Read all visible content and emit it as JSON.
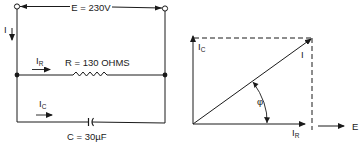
{
  "circuit": {
    "source_label": "E = 230V",
    "total_current_label": "I",
    "resistor": {
      "current_label": "I",
      "current_subscript": "R",
      "value_label": "R = 130 OHMS"
    },
    "capacitor": {
      "current_label": "I",
      "current_subscript": "C",
      "value_label": "C = 30µF"
    }
  },
  "phasor": {
    "capacitive_current_label": "I",
    "capacitive_current_subscript": "C",
    "total_current_label": "I",
    "resistive_current_label": "I",
    "resistive_current_subscript": "R",
    "angle_label": "φ",
    "voltage_reference_label": "E"
  },
  "colors": {
    "line": "#1a1a1a",
    "background": "#ffffff"
  }
}
